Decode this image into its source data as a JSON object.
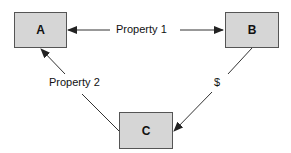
{
  "nodes": [
    {
      "id": "A",
      "label": "A"
    },
    {
      "id": "B",
      "label": "B"
    },
    {
      "id": "C",
      "label": "C"
    }
  ],
  "edges": [
    {
      "from": "B",
      "to": "A",
      "label": "Property 1",
      "bidirectional": true
    },
    {
      "from": "C",
      "to": "A",
      "label": "Property 2"
    },
    {
      "from": "B",
      "to": "C",
      "label": "$"
    }
  ],
  "colors": {
    "box_fill": "#d6d6d6",
    "stroke": "#333333"
  }
}
